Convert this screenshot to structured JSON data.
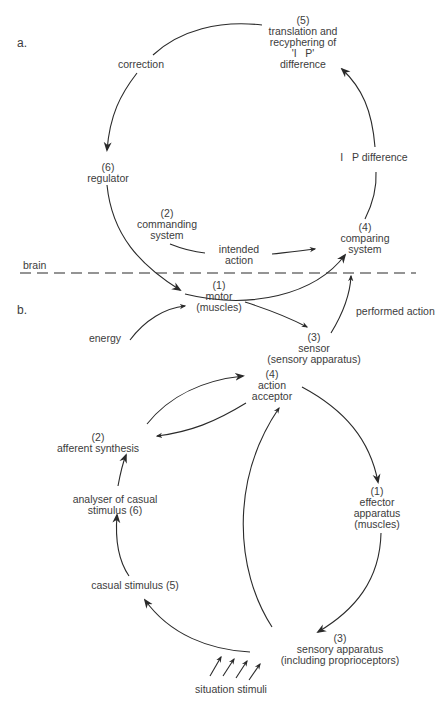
{
  "panels": {
    "a": {
      "label": "a.",
      "nodes": {
        "translation": "(5)\ntranslation and\nrecyphering of\n'I   P'\ndifference",
        "correction": "correction",
        "regulator": "(6)\nregulator",
        "ip_difference": "I   P difference",
        "commanding": "(2)\ncommanding\nsystem",
        "intended_action": "intended\naction",
        "comparing": "(4)\ncomparing\nsystem",
        "brain": "brain",
        "motor": "(1)\nmotor\n(muscles)",
        "energy": "energy",
        "sensor": "(3)\nsensor\n(sensory apparatus)",
        "performed_action": "performed action"
      }
    },
    "b": {
      "label": "b.",
      "nodes": {
        "action_acceptor": "(4)\naction\nacceptor",
        "afferent_synthesis": "(2)\nafferent synthesis",
        "analyser": "analyser of casual\nstimulus (6)",
        "effector": "(1)\neffector\napparatus\n(muscles)",
        "casual_stimulus": "casual stimulus (5)",
        "sensory_apparatus": "(3)\nsensory apparatus\n(including proprioceptors)",
        "situation_stimuli": "situation stimuli"
      }
    }
  },
  "colors": {
    "stroke": "#2a2a2a",
    "text": "#3c3c3c"
  }
}
